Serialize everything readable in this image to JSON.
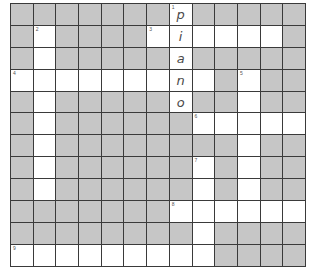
{
  "puzzle": {
    "rows": 12,
    "cols": 13,
    "colors": {
      "block": "#c6c6c6",
      "open": "#ffffff",
      "line": "#3a3a3a",
      "letter": "#4a4a4a"
    },
    "grid": [
      "#######.#####",
      "#.####......#",
      "#.#####.#####",
      ".........#.##",
      "#.#####.##.##",
      "#.######.....",
      "#.########.##",
      "#.######.#.##",
      "#.######.#.##",
      "#######......",
      "########.####",
      ".........####"
    ],
    "numbers": [
      {
        "r": 0,
        "c": 7,
        "n": "1"
      },
      {
        "r": 1,
        "c": 1,
        "n": "2"
      },
      {
        "r": 1,
        "c": 6,
        "n": "3"
      },
      {
        "r": 3,
        "c": 0,
        "n": "4"
      },
      {
        "r": 3,
        "c": 10,
        "n": "5"
      },
      {
        "r": 5,
        "c": 8,
        "n": "6"
      },
      {
        "r": 7,
        "c": 8,
        "n": "7"
      },
      {
        "r": 9,
        "c": 7,
        "n": "8"
      },
      {
        "r": 11,
        "c": 0,
        "n": "9"
      }
    ],
    "letters": [
      {
        "r": 0,
        "c": 7,
        "ch": "p"
      },
      {
        "r": 1,
        "c": 7,
        "ch": "i"
      },
      {
        "r": 2,
        "c": 7,
        "ch": "a"
      },
      {
        "r": 3,
        "c": 7,
        "ch": "n"
      },
      {
        "r": 4,
        "c": 7,
        "ch": "o"
      }
    ]
  }
}
